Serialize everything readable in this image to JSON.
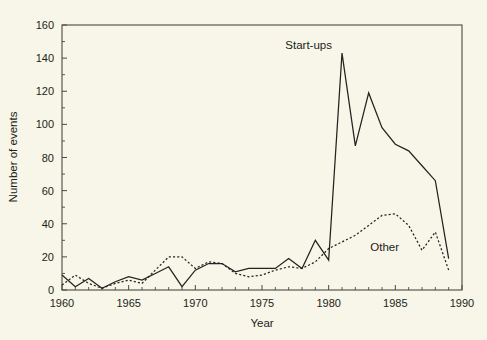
{
  "chart_data": {
    "type": "line",
    "title": "",
    "xlabel": "Year",
    "ylabel": "Number of events",
    "xlim": [
      1960,
      1990
    ],
    "ylim": [
      0,
      160
    ],
    "xticks": [
      1960,
      1965,
      1970,
      1975,
      1980,
      1985,
      1990
    ],
    "xtick_labels": [
      "1960",
      "1965",
      "1970",
      "1975",
      "1980",
      "1985",
      "1990"
    ],
    "xtick_minor_step": 1,
    "yticks": [
      0,
      20,
      40,
      60,
      80,
      100,
      120,
      140,
      160
    ],
    "ytick_labels": [
      "0",
      "20",
      "40",
      "60",
      "80",
      "100",
      "120",
      "140",
      "160"
    ],
    "ytick_minor_step": 10,
    "grid": false,
    "legend_position": "inline-annotation",
    "x": [
      1960,
      1961,
      1962,
      1963,
      1964,
      1965,
      1966,
      1967,
      1968,
      1969,
      1970,
      1971,
      1972,
      1973,
      1974,
      1975,
      1976,
      1977,
      1978,
      1979,
      1980,
      1981,
      1982,
      1983,
      1984,
      1985,
      1986,
      1987,
      1988,
      1989
    ],
    "series": [
      {
        "name": "Start-ups",
        "style": "solid",
        "label": "Start-ups",
        "label_x": 1978.5,
        "label_y": 148,
        "values": [
          9,
          2,
          7,
          1,
          5,
          8,
          6,
          10,
          14,
          2,
          12,
          16,
          16,
          11,
          13,
          13,
          13,
          19,
          13,
          30,
          18,
          143,
          87,
          119,
          98,
          88,
          84,
          75,
          66,
          19
        ]
      },
      {
        "name": "Other",
        "style": "dotted",
        "label": "Other",
        "label_x": 1984.2,
        "label_y": 26,
        "values": [
          3,
          9,
          4,
          1,
          4,
          6,
          4,
          12,
          20,
          20,
          13,
          17,
          16,
          10,
          8,
          9,
          12,
          14,
          13,
          17,
          25,
          29,
          33,
          39,
          45,
          46,
          39,
          24,
          35,
          12
        ]
      }
    ]
  },
  "axes": {
    "x_title": "Year",
    "y_title": "Number of events"
  },
  "colors": {
    "background": "#f7f6e8",
    "ink": "#232320",
    "axis": "#4a4a40"
  }
}
